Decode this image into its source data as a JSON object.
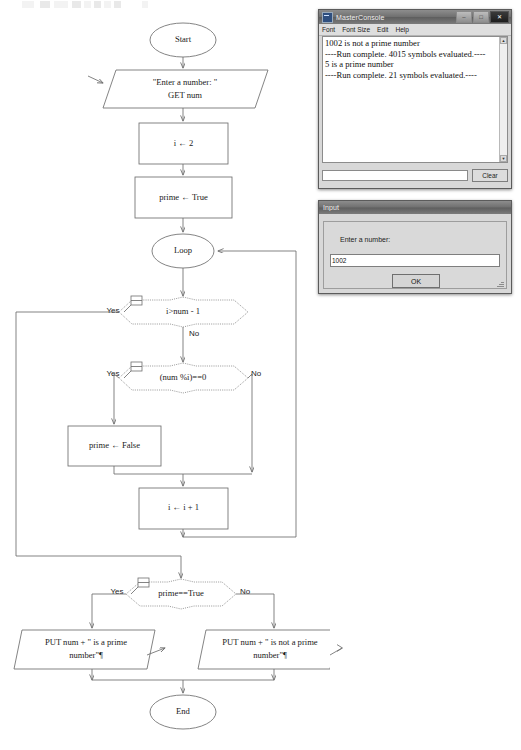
{
  "toolbar": {
    "present": true
  },
  "flowchart": {
    "nodes": {
      "start": "Start",
      "input": "\"Enter a number: \"",
      "input2": "GET num",
      "init_i": "i ← 2",
      "init_prime": "prime ← True",
      "loop": "Loop",
      "cond_i": "i>num - 1",
      "cond_mod": "(num %i)==0",
      "set_false": "prime ← False",
      "incr": "i ← i + 1",
      "cond_prime": "prime==True",
      "out_prime_1": "PUT num + \" is a prime",
      "out_prime_2": "number\"¶",
      "out_not_1": "PUT num + \" is not a prime",
      "out_not_2": "number\"¶",
      "end": "End"
    },
    "branch_labels": {
      "yes": "Yes",
      "no": "No"
    }
  },
  "console_window": {
    "title": "MasterConsole",
    "icon": "app-icon",
    "menu": [
      "Font",
      "Font Size",
      "Edit",
      "Help"
    ],
    "window_buttons": {
      "minimize": "–",
      "maximize": "□",
      "close": "✕"
    },
    "lines": [
      "1002 is not a prime number",
      "----Run complete.  4015 symbols evaluated.----",
      "5 is a prime number",
      "----Run complete.  21 symbols evaluated.----"
    ],
    "input_value": "",
    "clear_label": "Clear",
    "scroll_up": "▲",
    "scroll_down": "▼"
  },
  "input_dialog": {
    "title": "Input",
    "prompt": "Enter a number:",
    "field_value": "1002",
    "ok_label": "OK"
  },
  "colors": {
    "shape_stroke": "#6e6e6e",
    "diamond_stroke": "#8e8e8e",
    "page_bg": "#ffffff",
    "window_chrome": "#d8d8d8"
  }
}
